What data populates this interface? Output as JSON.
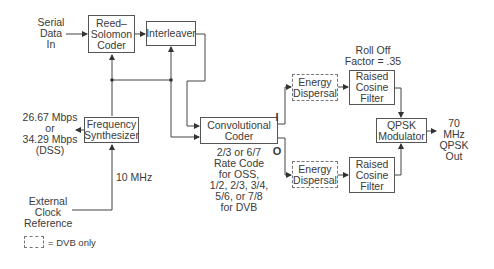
{
  "diagram": {
    "blocks": {
      "reed_solomon": "Reed–\nSolomon\nCoder",
      "interleaver": "Interleaver",
      "frequency_synthesizer": "Frequency\nSynthesizer",
      "convolutional_coder": "Convolutional\nCoder",
      "energy_dispersal_i": "Energy\nDispersal",
      "energy_dispersal_q": "Energy\nDispersal",
      "raised_cosine_i": "Raised\nCosine\nFilter",
      "raised_cosine_q": "Raised\nCosine\nFilter",
      "qpsk_modulator": "QPSK\nModulator"
    },
    "labels": {
      "serial_data_in": "Serial\nData\nIn",
      "bitrate": "26.67 Mbps\nor\n34.29 Mbps\n(DSS)",
      "external_clock": "External\nClock\nReference",
      "ten_mhz": "10 MHz",
      "rate_code": "2/3 or 6/7\nRate Code\nfor OSS,\n1/2, 2/3, 3/4,\n5/6, or 7/8\nfor DVB",
      "roll_off": "Roll Off\nFactor = .35",
      "output": "70 MHz\nQPSK\nOut",
      "i_branch": "I",
      "q_branch": "O"
    },
    "legend": {
      "dashed_box_meaning": "= DVB only"
    }
  }
}
